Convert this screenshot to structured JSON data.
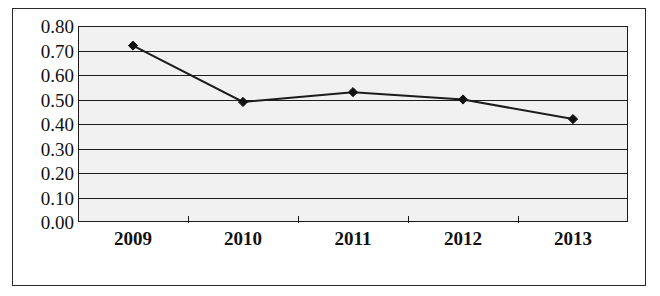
{
  "chart_data": {
    "type": "line",
    "title": "",
    "subtitle": "",
    "xlabel": "",
    "ylabel": "",
    "categories": [
      "2009",
      "2010",
      "2011",
      "2012",
      "2013"
    ],
    "values": [
      0.72,
      0.49,
      0.53,
      0.5,
      0.42
    ],
    "series": [
      {
        "name": "",
        "values": [
          0.72,
          0.49,
          0.53,
          0.5,
          0.42
        ]
      }
    ],
    "ylim": [
      0.0,
      0.8
    ],
    "ytick_labels": [
      "0.80",
      "0.70",
      "0.60",
      "0.50",
      "0.40",
      "0.30",
      "0.20",
      "0.10",
      "0.00"
    ],
    "ytick_values": [
      0.8,
      0.7,
      0.6,
      0.5,
      0.4,
      0.3,
      0.2,
      0.1,
      0.0
    ],
    "xtick_labels": [
      "2009",
      "2010",
      "2011",
      "2012",
      "2013"
    ],
    "grid": true,
    "grid_axis": "y",
    "legend": false,
    "legend_position": "none",
    "marker": "diamond",
    "annotations": []
  },
  "style": {
    "line_color": "#1c1c1c",
    "marker_color": "#111111",
    "plot_background": "#f1f1f1",
    "grid_color": "#1c1c1c",
    "frame_color": "#2b2b2b",
    "page_background": "#ffffff",
    "text_color": "#111111"
  }
}
